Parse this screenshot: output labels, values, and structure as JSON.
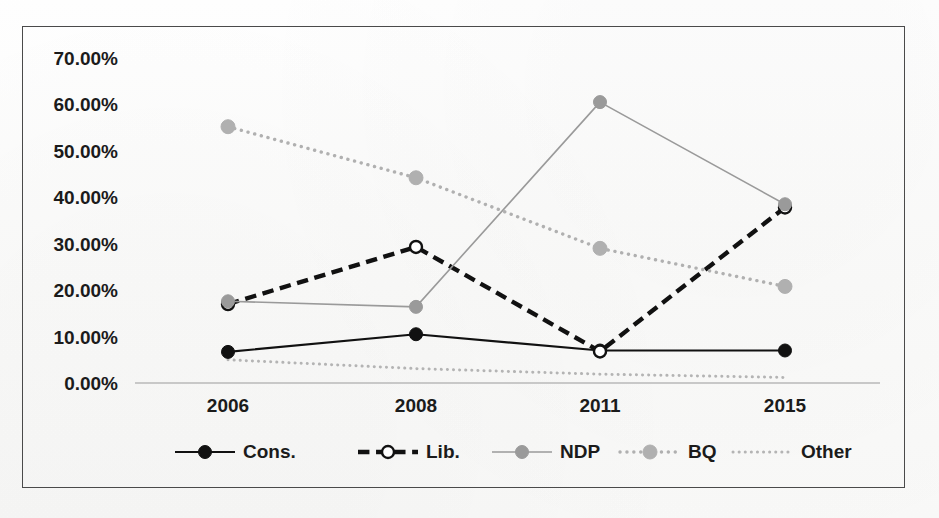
{
  "chart_data": {
    "type": "line",
    "title": "",
    "subtitle": "",
    "xlabel": "",
    "ylabel": "",
    "categories": [
      "2006",
      "2008",
      "2011",
      "2015"
    ],
    "ylim": [
      0,
      70
    ],
    "ytick_values": [
      0,
      10,
      20,
      30,
      40,
      50,
      60,
      70
    ],
    "ytick_labels": [
      "0.00%",
      "10.00%",
      "20.00%",
      "30.00%",
      "40.00%",
      "50.00%",
      "60.00%",
      "70.00%"
    ],
    "grid": false,
    "legend_position": "bottom",
    "series": [
      {
        "name": "Cons.",
        "values": [
          6.7,
          10.5,
          7.0,
          7.0
        ],
        "color": "#111111",
        "line_style": "solid",
        "line_width": 2.2,
        "marker": "filled-circle",
        "marker_size": 6.5
      },
      {
        "name": "Lib.",
        "values": [
          17.0,
          29.3,
          6.8,
          37.8
        ],
        "color": "#111111",
        "line_style": "dashed",
        "line_width": 4.4,
        "marker": "open-circle",
        "marker_size": 6.0
      },
      {
        "name": "NDP",
        "values": [
          17.6,
          16.4,
          60.5,
          38.5
        ],
        "color": "#9a9a9a",
        "line_style": "solid",
        "line_width": 1.6,
        "marker": "filled-circle",
        "marker_size": 6.5
      },
      {
        "name": "BQ",
        "values": [
          55.2,
          44.2,
          29.0,
          20.8
        ],
        "color": "#b0b0b0",
        "line_style": "dotted",
        "line_width": 3.4,
        "marker": "filled-circle",
        "marker_size": 7.0
      },
      {
        "name": "Other",
        "values": [
          5.0,
          3.1,
          1.9,
          1.2
        ],
        "color": "#b4b4b4",
        "line_style": "dotted",
        "line_width": 3.0,
        "marker": "none",
        "marker_size": 0
      }
    ]
  },
  "axis": {
    "baseline_color": "#b9b9b9"
  },
  "frame": {
    "border_color": "#4a4a4a"
  }
}
